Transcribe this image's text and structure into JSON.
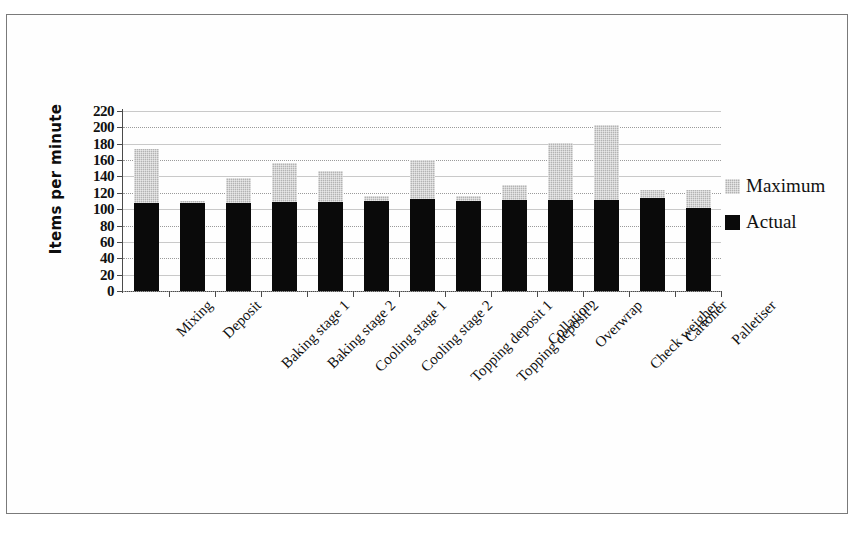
{
  "chart_data": {
    "type": "bar",
    "stacked": true,
    "title": "",
    "xlabel": "",
    "ylabel": "Items per minute",
    "ylim": [
      0,
      220
    ],
    "ytick_step": 20,
    "yticks": [
      0,
      20,
      40,
      60,
      80,
      100,
      120,
      140,
      160,
      180,
      200,
      220
    ],
    "ytick_labels": [
      "0",
      "20",
      "40",
      "60",
      "80",
      "100",
      "120",
      "140",
      "160",
      "180",
      "200",
      "220"
    ],
    "grid": true,
    "legend_position": "right",
    "categories": [
      "Mixing",
      "Deposit",
      "Baking stage 1",
      "Baking stage 2",
      "Cooling stage 1",
      "Cooling stage 2",
      "Topping deposit 1",
      "Topping deposit 2",
      "Collation",
      "Overwrap",
      "Check weigher",
      "Cartoner",
      "Palletiser"
    ],
    "series": [
      {
        "name": "Actual",
        "color": "#0a0a0a",
        "values": [
          108,
          107,
          108,
          109,
          109,
          110,
          112,
          110,
          111,
          111,
          111,
          114,
          101
        ]
      },
      {
        "name": "Maximum",
        "color": "#b3b3b3",
        "values": [
          173,
          110,
          138,
          157,
          147,
          116,
          160,
          116,
          129,
          181,
          203,
          124,
          123
        ]
      }
    ],
    "legend": [
      {
        "label": "Maximum",
        "swatch": "max"
      },
      {
        "label": "Actual",
        "swatch": "actual"
      }
    ]
  }
}
